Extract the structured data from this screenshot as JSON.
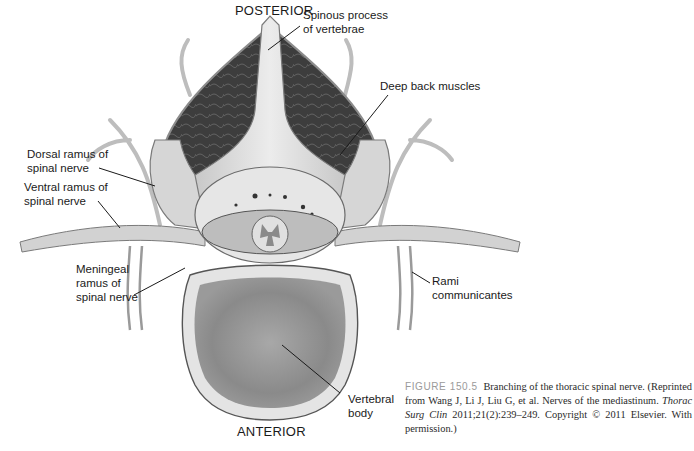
{
  "figure": {
    "orientation": {
      "top": "POSTERIOR",
      "bottom": "ANTERIOR"
    },
    "labels": {
      "spinous_process": "Spinous process\nof vertebrae",
      "deep_back_muscles": "Deep back muscles",
      "dorsal_ramus": "Dorsal ramus of\nspinal nerve",
      "ventral_ramus": "Ventral ramus of\nspinal nerve",
      "meningeal_ramus": "Meningeal\nramus of\nspinal nerve",
      "rami_communicantes": "Rami\ncommunicantes",
      "vertebral_body": "Vertebral\nbody"
    },
    "caption": {
      "figure_number": "FIGURE 150.5",
      "title": "Branching of the thoracic spinal nerve.",
      "reference_prefix": "(Reprinted from Wang J, Li J, Liu G, et al. Nerves of the mediastinum.",
      "journal": "Thorac Surg Clin",
      "reference_suffix": "2011;21(2):239–249. Copyright © 2011 Elsevier. With permission.)"
    },
    "colors": {
      "bone": "#d9d9d9",
      "muscle": "#3e3e3e",
      "nerve": "#cfcfcf",
      "outline": "#6a6a6a",
      "vertebral_body_core": "#8c8c8c"
    }
  }
}
